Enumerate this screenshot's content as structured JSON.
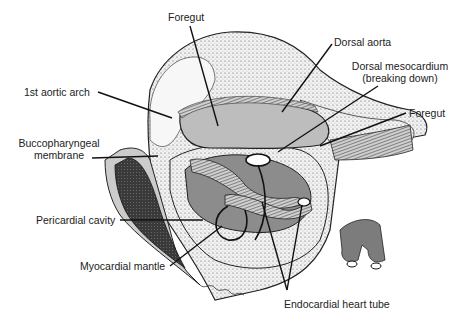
{
  "figure": {
    "type": "anatomical-illustration",
    "colors": {
      "background": "#ffffff",
      "outline": "#111111",
      "light_gray": "#bdbdbd",
      "mid_gray": "#8c8c8c",
      "dark": "#2a2a2a"
    }
  },
  "labels": {
    "foregut_top": "Foregut",
    "dorsal_aorta": "Dorsal aorta",
    "dorsal_mesocardium_line1": "Dorsal mesocardium",
    "dorsal_mesocardium_line2": "(breaking down)",
    "first_aortic_arch": "1st aortic arch",
    "foregut_right": "Foregut",
    "buccopharyngeal_line1": "Buccopharyngeal",
    "buccopharyngeal_line2": "membrane",
    "pericardial_cavity": "Pericardial cavity",
    "myocardial_mantle": "Myocardial mantle",
    "endocardial_heart_tube": "Endocardial heart tube"
  }
}
